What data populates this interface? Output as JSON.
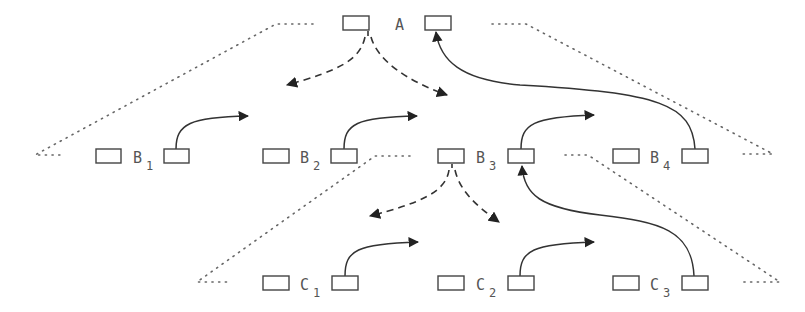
{
  "diagram": {
    "type": "tree-of-nodes-with-pointers",
    "colors": {
      "line": "#333333",
      "dotted": "#666666",
      "text": "#555555",
      "background": "#ffffff"
    },
    "nodes": [
      {
        "id": "A",
        "label": "A",
        "sub": "",
        "left_box": [
          343,
          16
        ],
        "right_box": [
          425,
          16
        ],
        "text_x": 369,
        "text_y": 30
      },
      {
        "id": "B1",
        "label": "B",
        "sub": "1",
        "left_box": [
          96,
          149
        ],
        "right_box": [
          164,
          149
        ],
        "text_x": 132,
        "text_y": 163
      },
      {
        "id": "B2",
        "label": "B",
        "sub": "2",
        "left_box": [
          263,
          149
        ],
        "right_box": [
          330,
          149
        ],
        "text_x": 300,
        "text_y": 163
      },
      {
        "id": "B3",
        "label": "B",
        "sub": "3",
        "left_box": [
          438,
          149
        ],
        "right_box": [
          508,
          149
        ],
        "text_x": 476,
        "text_y": 163
      },
      {
        "id": "B4",
        "label": "B",
        "sub": "4",
        "left_box": [
          613,
          149
        ],
        "right_box": [
          682,
          149
        ],
        "text_x": 650,
        "text_y": 163
      },
      {
        "id": "C1",
        "label": "C",
        "sub": "1",
        "left_box": [
          263,
          276
        ],
        "right_box": [
          331,
          276
        ],
        "text_x": 300,
        "text_y": 290
      },
      {
        "id": "C2",
        "label": "C",
        "sub": "2",
        "left_box": [
          438,
          276
        ],
        "right_box": [
          508,
          276
        ],
        "text_x": 476,
        "text_y": 290
      },
      {
        "id": "C3",
        "label": "C",
        "sub": "3",
        "left_box": [
          613,
          276
        ],
        "right_box": [
          682,
          276
        ],
        "text_x": 650,
        "text_y": 290
      }
    ],
    "edges": [
      {
        "from": "A.left",
        "to": "left",
        "style": "dashed"
      },
      {
        "from": "A.left",
        "to": "right",
        "style": "dashed"
      },
      {
        "from": "B3.left",
        "to": "left",
        "style": "dashed"
      },
      {
        "from": "B3.left",
        "to": "right",
        "style": "dashed"
      },
      {
        "from": "B1.right",
        "to": "next",
        "style": "solid"
      },
      {
        "from": "B2.right",
        "to": "next",
        "style": "solid"
      },
      {
        "from": "B3.right",
        "to": "next",
        "style": "solid"
      },
      {
        "from": "B4.right",
        "to": "A.right",
        "style": "solid"
      },
      {
        "from": "C1.right",
        "to": "next",
        "style": "solid"
      },
      {
        "from": "C2.right",
        "to": "next",
        "style": "solid"
      },
      {
        "from": "C3.right",
        "to": "B3.right",
        "style": "solid"
      }
    ]
  }
}
